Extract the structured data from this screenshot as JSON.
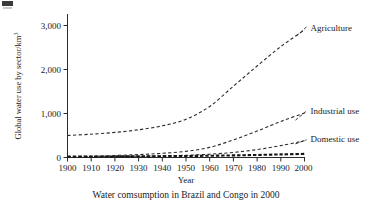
{
  "figure": {
    "caption": "Water comsumption in Brazil and Congo in 2000",
    "corner_mark": "page-artifact"
  },
  "chart_data": {
    "type": "line",
    "title": "",
    "subtitle": "",
    "xlabel": "Year",
    "ylabel": "Global water use by sector/km",
    "ylabel_superscript": "3",
    "x": [
      1900,
      1910,
      1920,
      1930,
      1940,
      1950,
      1960,
      1970,
      1980,
      1990,
      2000
    ],
    "xticklabels": [
      "1900",
      "1910",
      "1920",
      "1930",
      "1940",
      "1950",
      "1960",
      "1970",
      "1980",
      "1990",
      "2000"
    ],
    "yticklabels": [
      "0",
      "1,000",
      "2,000",
      "3,000"
    ],
    "yticks": [
      0,
      1000,
      2000,
      3000
    ],
    "xlim": [
      1900,
      2000
    ],
    "ylim": [
      0,
      3200
    ],
    "grid": false,
    "legend_position": "inline-right-of-curves",
    "series": [
      {
        "name": "Agriculture",
        "label": "Agriculture",
        "linestyle": "dashed",
        "color": "#2b2b2b",
        "values": [
          500,
          530,
          570,
          630,
          720,
          870,
          1160,
          1620,
          2080,
          2520,
          2900
        ]
      },
      {
        "name": "Industrial use",
        "label": "Industrial use",
        "linestyle": "dashed",
        "color": "#2b2b2b",
        "values": [
          20,
          30,
          45,
          65,
          95,
          140,
          230,
          400,
          600,
          820,
          1010
        ]
      },
      {
        "name": "Domestic use",
        "label": "Domestic use",
        "linestyle": "dashed",
        "color": "#2b2b2b",
        "values": [
          15,
          18,
          22,
          28,
          36,
          50,
          75,
          115,
          180,
          270,
          380
        ]
      }
    ],
    "baseline_series": {
      "name": "baseline-overlay",
      "note": "heavy dashed near-zero band along the x-axis",
      "values": [
        20,
        22,
        24,
        27,
        30,
        34,
        40,
        48,
        58,
        70,
        82
      ]
    }
  }
}
